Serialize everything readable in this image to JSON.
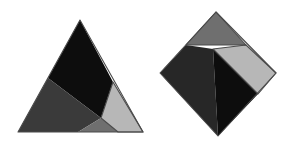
{
  "page": {
    "background_color": "#ffffff",
    "width": 294,
    "height": 145
  },
  "palette": {
    "black": "#0d0d0d",
    "dark_gray": "#3a3a3a",
    "medium_gray": "#6f6f6f",
    "light_gray": "#b7b7b7",
    "outline": "#4a4a4a",
    "background": "#ffffff"
  },
  "figures": [
    {
      "id": "left-triangle",
      "name": "dissected-triangle",
      "shape": "triangle",
      "outline_color": "#4a4a4a",
      "vertices": [
        [
          80,
          20
        ],
        [
          18,
          132
        ],
        [
          143,
          132
        ]
      ],
      "pieces": [
        {
          "id": "left-piece-black",
          "name": "black-piece",
          "fill": "#0d0d0d",
          "points": [
            [
              80,
              20
            ],
            [
              48,
              78
            ],
            [
              101,
              118
            ],
            [
              113,
              82
            ]
          ]
        },
        {
          "id": "left-piece-dark-gray",
          "name": "dark-gray-piece",
          "fill": "#3a3a3a",
          "points": [
            [
              48,
              78
            ],
            [
              18,
              132
            ],
            [
              78,
              132
            ],
            [
              101,
              118
            ]
          ]
        },
        {
          "id": "left-piece-medium-gray",
          "name": "medium-gray-piece",
          "fill": "#6f6f6f",
          "points": [
            [
              101,
              118
            ],
            [
              78,
              132
            ],
            [
              118,
              132
            ]
          ]
        },
        {
          "id": "left-piece-light-gray",
          "name": "light-gray-piece",
          "fill": "#b7b7b7",
          "points": [
            [
              113,
              82
            ],
            [
              101,
              118
            ],
            [
              118,
              132
            ],
            [
              143,
              132
            ]
          ]
        }
      ]
    },
    {
      "id": "right-diamond",
      "name": "dissected-diamond",
      "shape": "diamond",
      "outline_color": "#4a4a4a",
      "vertices": [
        [
          216,
          12
        ],
        [
          160,
          73
        ],
        [
          218,
          136
        ],
        [
          276,
          73
        ]
      ],
      "pieces": [
        {
          "id": "right-piece-medium-gray",
          "name": "medium-gray-piece",
          "fill": "#6f6f6f",
          "points": [
            [
              216,
              12
            ],
            [
              186,
              45
            ],
            [
              246,
              45
            ]
          ]
        },
        {
          "id": "right-piece-dark-gray",
          "name": "dark-gray-piece",
          "fill": "#272727",
          "points": [
            [
              186,
              45
            ],
            [
              160,
              73
            ],
            [
              218,
              136
            ],
            [
              213,
              49
            ]
          ]
        },
        {
          "id": "right-piece-black",
          "name": "black-piece",
          "fill": "#0d0d0d",
          "points": [
            [
              213,
              49
            ],
            [
              218,
              136
            ],
            [
              258,
              94
            ]
          ]
        },
        {
          "id": "right-piece-light-gray",
          "name": "light-gray-piece",
          "fill": "#b7b7b7",
          "points": [
            [
              213,
              49
            ],
            [
              246,
              45
            ],
            [
              276,
              73
            ],
            [
              258,
              94
            ]
          ]
        }
      ]
    }
  ]
}
